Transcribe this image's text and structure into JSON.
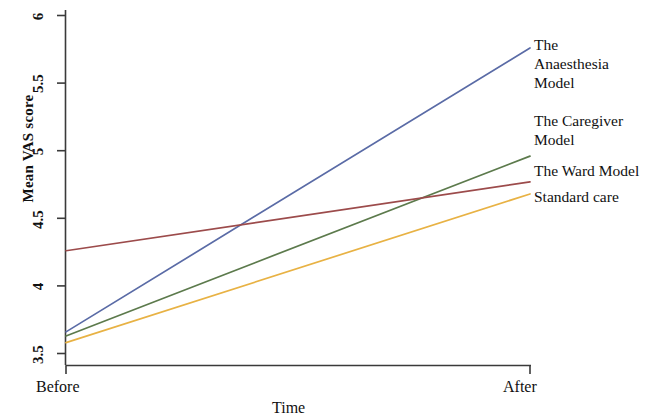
{
  "chart_data": {
    "type": "line",
    "title": "",
    "subtitle": "",
    "xlabel": "Time",
    "ylabel": "Mean VAS score",
    "x": [
      "Before",
      "After"
    ],
    "categories": [
      "Before",
      "After"
    ],
    "xtick_labels": [
      "Before",
      "After"
    ],
    "ytick_labels": [
      "3.5",
      "4",
      "4.5",
      "5",
      "5.5",
      "6"
    ],
    "ytick_values": [
      3.5,
      4,
      4.5,
      5,
      5.5,
      6
    ],
    "ylim": [
      3.42,
      6.05
    ],
    "xlim": [
      0,
      1
    ],
    "grid": false,
    "legend_position": "right",
    "series": [
      {
        "name": "The Anaesthesia Model",
        "legend_lines": [
          "The",
          "Anaesthesia",
          "Model"
        ],
        "color": "#5a6ba6",
        "values": [
          3.66,
          5.76
        ]
      },
      {
        "name": "The Caregiver Model",
        "legend_lines": [
          "The Caregiver",
          "Model"
        ],
        "color": "#5c7a4c",
        "values": [
          3.63,
          4.96
        ]
      },
      {
        "name": "The Ward Model",
        "legend_lines": [
          "The Ward Model"
        ],
        "color": "#9c4b4b",
        "values": [
          4.26,
          4.77
        ]
      },
      {
        "name": "Standard care",
        "legend_lines": [
          "Standard care"
        ],
        "color": "#e8b244",
        "values": [
          3.58,
          4.68
        ]
      }
    ],
    "axis_color": "#3a3a3a",
    "text_color": "#111111",
    "background": "#ffffff"
  },
  "axis": {
    "ylabel": "Mean VAS score",
    "xlabel": "Time",
    "yticks": [
      "6",
      "5.5",
      "5",
      "4.5",
      "4",
      "3.5"
    ],
    "xticks": [
      "Before",
      "After"
    ]
  },
  "legend": {
    "entries": [
      {
        "id": "anaesthesia",
        "text": "The\nAnaesthesia\nModel"
      },
      {
        "id": "caregiver",
        "text": "The Caregiver\nModel"
      },
      {
        "id": "ward",
        "text": "The Ward Model"
      },
      {
        "id": "standard",
        "text": "Standard care"
      }
    ]
  }
}
